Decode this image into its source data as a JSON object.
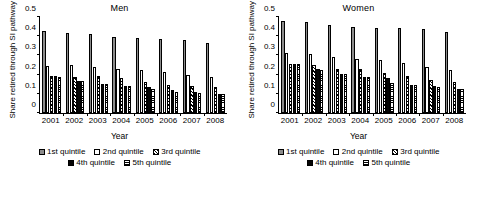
{
  "chart_data": [
    {
      "type": "bar",
      "title": "Men",
      "xlabel": "Year",
      "ylabel": "Share retired through SI pathway",
      "categories": [
        "2001",
        "2002",
        "2003",
        "2004",
        "2005",
        "2006",
        "2007",
        "2008"
      ],
      "yticks": [
        "0",
        "0.1",
        "0.2",
        "0.3",
        "0.4",
        "0.5"
      ],
      "ylim": [
        0,
        0.5
      ],
      "grid": false,
      "legend_position": "bottom",
      "series": [
        {
          "name": "1st quintile",
          "values": [
            0.428,
            0.419,
            0.41,
            0.397,
            0.391,
            0.383,
            0.378,
            0.363
          ]
        },
        {
          "name": "2nd quintile",
          "values": [
            0.245,
            0.25,
            0.241,
            0.231,
            0.222,
            0.213,
            0.2,
            0.186
          ]
        },
        {
          "name": "3rd quintile",
          "values": [
            0.192,
            0.189,
            0.194,
            0.181,
            0.161,
            0.146,
            0.139,
            0.133
          ]
        },
        {
          "name": "4th quintile",
          "values": [
            0.191,
            0.166,
            0.152,
            0.14,
            0.133,
            0.122,
            0.108,
            0.1
          ]
        },
        {
          "name": "5th quintile",
          "values": [
            0.189,
            0.167,
            0.152,
            0.14,
            0.126,
            0.112,
            0.104,
            0.097
          ]
        }
      ]
    },
    {
      "type": "bar",
      "title": "Women",
      "xlabel": "Year",
      "ylabel": "Share retired through SI pathway",
      "categories": [
        "2001",
        "2002",
        "2003",
        "2004",
        "2005",
        "2006",
        "2007",
        "2008"
      ],
      "yticks": [
        "0",
        "0.1",
        "0.2",
        "0.3",
        "0.4",
        "0.5"
      ],
      "ylim": [
        0,
        0.5
      ],
      "grid": false,
      "legend_position": "bottom",
      "series": [
        {
          "name": "1st quintile",
          "values": [
            0.481,
            0.474,
            0.459,
            0.448,
            0.445,
            0.445,
            0.44,
            0.422
          ]
        },
        {
          "name": "2nd quintile",
          "values": [
            0.31,
            0.306,
            0.294,
            0.28,
            0.276,
            0.261,
            0.241,
            0.224
          ]
        },
        {
          "name": "3rd quintile",
          "values": [
            0.256,
            0.251,
            0.228,
            0.229,
            0.211,
            0.191,
            0.172,
            0.161
          ]
        },
        {
          "name": "4th quintile",
          "values": [
            0.256,
            0.227,
            0.205,
            0.19,
            0.183,
            0.146,
            0.14,
            0.127
          ]
        },
        {
          "name": "5th quintile",
          "values": [
            0.255,
            0.226,
            0.205,
            0.19,
            0.158,
            0.144,
            0.133,
            0.124
          ]
        }
      ]
    }
  ],
  "series_styles": [
    {
      "name": "1st quintile",
      "fill": "#8c8c8c",
      "pattern": "solid-gray"
    },
    {
      "name": "2nd quintile",
      "fill": "#ffffff",
      "pattern": "outline-white"
    },
    {
      "name": "3rd quintile",
      "fill": "#ffffff",
      "pattern": "diagonal-hatch"
    },
    {
      "name": "4th quintile",
      "fill": "#050505",
      "pattern": "solid-black"
    },
    {
      "name": "5th quintile",
      "fill": "#ffffff",
      "pattern": "horizontal-lines"
    }
  ]
}
